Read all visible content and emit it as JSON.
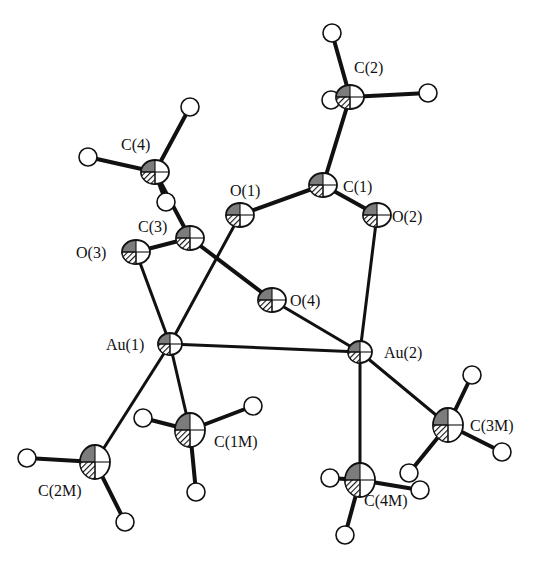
{
  "diagram": {
    "type": "ORTEP molecular structure",
    "atoms": [
      {
        "id": "C2",
        "label": "C(2)",
        "x": 350,
        "y": 97,
        "lx": 354,
        "ly": 73
      },
      {
        "id": "C1",
        "label": "C(1)",
        "x": 323,
        "y": 185,
        "lx": 343,
        "ly": 192
      },
      {
        "id": "O2",
        "label": "O(2)",
        "x": 377,
        "y": 215,
        "lx": 392,
        "ly": 222
      },
      {
        "id": "O1",
        "label": "O(1)",
        "x": 240,
        "y": 215,
        "lx": 230,
        "ly": 196
      },
      {
        "id": "C4",
        "label": "C(4)",
        "x": 155,
        "y": 172,
        "lx": 121,
        "ly": 150
      },
      {
        "id": "C3",
        "label": "C(3)",
        "x": 190,
        "y": 238,
        "lx": 138,
        "ly": 232
      },
      {
        "id": "O3",
        "label": "O(3)",
        "x": 136,
        "y": 252,
        "lx": 76,
        "ly": 258
      },
      {
        "id": "O4",
        "label": "O(4)",
        "x": 272,
        "y": 300,
        "lx": 290,
        "ly": 306
      },
      {
        "id": "Au1",
        "label": "Au(1)",
        "x": 170,
        "y": 344,
        "lx": 106,
        "ly": 350
      },
      {
        "id": "Au2",
        "label": "Au(2)",
        "x": 360,
        "y": 352,
        "lx": 384,
        "ly": 358
      },
      {
        "id": "C1M",
        "label": "C(1M)",
        "x": 190,
        "y": 430,
        "lx": 214,
        "ly": 447
      },
      {
        "id": "C2M",
        "label": "C(2M)",
        "x": 95,
        "y": 462,
        "lx": 38,
        "ly": 496
      },
      {
        "id": "C3M",
        "label": "C(3M)",
        "x": 448,
        "y": 425,
        "lx": 470,
        "ly": 431
      },
      {
        "id": "C4M",
        "label": "C(4M)",
        "x": 360,
        "y": 480,
        "lx": 364,
        "ly": 506
      }
    ],
    "bonds": [
      [
        "C2",
        "C1"
      ],
      [
        "C1",
        "O1"
      ],
      [
        "C1",
        "O2"
      ],
      [
        "C4",
        "C3"
      ],
      [
        "C3",
        "O3"
      ],
      [
        "C3",
        "O4"
      ],
      [
        "O3",
        "Au1"
      ],
      [
        "O1",
        "Au1"
      ],
      [
        "Au1",
        "Au2"
      ],
      [
        "O4",
        "Au2"
      ],
      [
        "O2",
        "Au2"
      ],
      [
        "Au1",
        "C1M"
      ],
      [
        "Au1",
        "C2M"
      ],
      [
        "Au2",
        "C3M"
      ],
      [
        "Au2",
        "C4M"
      ]
    ],
    "hydrogens": [
      {
        "parent": "C2",
        "x": 332,
        "y": 33
      },
      {
        "parent": "C2",
        "x": 428,
        "y": 93
      },
      {
        "parent": "C2",
        "x": 331,
        "y": 100
      },
      {
        "parent": "C4",
        "x": 190,
        "y": 107
      },
      {
        "parent": "C4",
        "x": 88,
        "y": 157
      },
      {
        "parent": "C4",
        "x": 166,
        "y": 202
      },
      {
        "parent": "C1M",
        "x": 143,
        "y": 418
      },
      {
        "parent": "C1M",
        "x": 253,
        "y": 406
      },
      {
        "parent": "C1M",
        "x": 196,
        "y": 492
      },
      {
        "parent": "C2M",
        "x": 27,
        "y": 458
      },
      {
        "parent": "C2M",
        "x": 95,
        "y": 455
      },
      {
        "parent": "C2M",
        "x": 125,
        "y": 522
      },
      {
        "parent": "C3M",
        "x": 472,
        "y": 375
      },
      {
        "parent": "C3M",
        "x": 502,
        "y": 452
      },
      {
        "parent": "C3M",
        "x": 409,
        "y": 473
      },
      {
        "parent": "C4M",
        "x": 330,
        "y": 478
      },
      {
        "parent": "C4M",
        "x": 420,
        "y": 490
      },
      {
        "parent": "C4M",
        "x": 345,
        "y": 535
      }
    ]
  }
}
